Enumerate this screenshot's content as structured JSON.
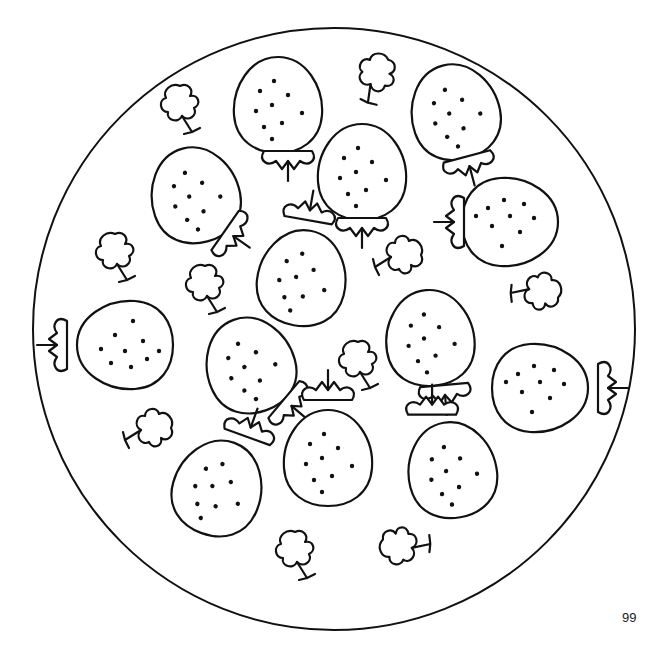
{
  "page": {
    "number": "99",
    "illustration": {
      "subject": "strawberries-and-flowers-mandala",
      "frame": "circle",
      "strawberry_count": 14,
      "flower_count": 12
    }
  }
}
